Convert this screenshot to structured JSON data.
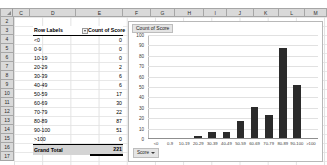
{
  "grid": {
    "column_headers": [
      "C",
      "D",
      "E",
      "F",
      "G",
      "H",
      "I",
      "J",
      "K",
      "L",
      "M"
    ],
    "row_numbers": [
      "2",
      "3",
      "4",
      "5",
      "6",
      "7",
      "8",
      "9",
      "10",
      "11",
      "12",
      "13",
      "14",
      "15",
      "16",
      "17"
    ],
    "corner_icon": "select-all-triangle-icon"
  },
  "pivot": {
    "header": {
      "row_labels": "Row Labels",
      "filter_icon": "filter-dropdown-icon",
      "value_field": "Count of Score"
    },
    "rows": [
      {
        "label": "<0",
        "count": "0"
      },
      {
        "label": "0-9",
        "count": "0"
      },
      {
        "label": "10-19",
        "count": "0"
      },
      {
        "label": "20-29",
        "count": "2"
      },
      {
        "label": "30-39",
        "count": "6"
      },
      {
        "label": "40-49",
        "count": "6"
      },
      {
        "label": "50-59",
        "count": "17"
      },
      {
        "label": "60-69",
        "count": "30"
      },
      {
        "label": "70-79",
        "count": "22"
      },
      {
        "label": "80-89",
        "count": "87"
      },
      {
        "label": "90-100",
        "count": "51"
      },
      {
        "label": ">100",
        "count": "0"
      }
    ],
    "total": {
      "label": "Grand Total",
      "count": "221"
    }
  },
  "chart": {
    "title": "Count of Score",
    "field_button": {
      "label": "Score",
      "icon": "chevron-down-icon"
    }
  },
  "chart_data": {
    "type": "bar",
    "title": "Count of Score",
    "xlabel": "",
    "ylabel": "",
    "categories": [
      "<0",
      "0-9",
      "10-19",
      "20-29",
      "30-39",
      "40-49",
      "50-59",
      "60-69",
      "70-79",
      "80-89",
      "90-100",
      ">100"
    ],
    "values": [
      0,
      0,
      0,
      2,
      6,
      6,
      17,
      30,
      22,
      87,
      51,
      0
    ],
    "ylim": [
      0,
      100
    ],
    "yticks": [
      "0",
      "10",
      "20",
      "30",
      "40",
      "50",
      "60",
      "70",
      "80",
      "90",
      "100"
    ],
    "grid": true,
    "legend_position": "bottom-left",
    "series": [
      {
        "name": "Count of Score",
        "values": [
          0,
          0,
          0,
          2,
          6,
          6,
          17,
          30,
          22,
          87,
          51,
          0
        ]
      }
    ],
    "bar_color": "#2b2b2b"
  }
}
